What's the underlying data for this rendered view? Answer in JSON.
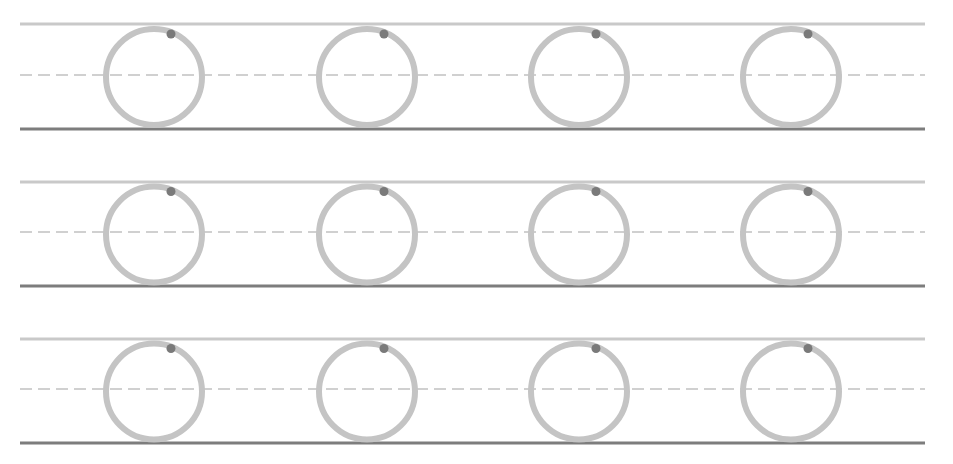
{
  "worksheet": {
    "type": "letter-tracing",
    "letter": "O",
    "width": 953,
    "height": 464,
    "colors": {
      "background": "#ffffff",
      "top_line": "#c9c9c9",
      "mid_line": "#d0d0d0",
      "base_line": "#7d7d7d",
      "letter_stroke": "#c4c4c4",
      "start_dot": "#7a7a7a"
    },
    "line_x_start": 20,
    "line_x_end": 925,
    "rows": [
      {
        "top_y": 24,
        "mid_y": 75,
        "base_y": 129
      },
      {
        "top_y": 182,
        "mid_y": 232,
        "base_y": 286
      },
      {
        "top_y": 339,
        "mid_y": 389,
        "base_y": 443
      }
    ],
    "columns_cx": [
      154,
      367,
      579,
      791
    ],
    "letter_geometry": {
      "radius": 48,
      "stroke_width": 6,
      "dot_offset_x": 17,
      "dot_offset_y": -43,
      "dot_radius": 4.5
    }
  }
}
